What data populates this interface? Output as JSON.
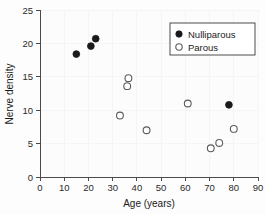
{
  "chart_data": {
    "type": "scatter",
    "title": "",
    "xlabel": "Age (years)",
    "ylabel": "Nerve density",
    "xlim": [
      0,
      90
    ],
    "ylim": [
      0,
      25
    ],
    "xticks": [
      0,
      10,
      20,
      30,
      40,
      50,
      60,
      70,
      80,
      90
    ],
    "yticks": [
      0,
      5,
      10,
      15,
      20,
      25
    ],
    "grid": true,
    "legend_position": "top-right",
    "series": [
      {
        "name": "Nulliparous",
        "marker": "filled-circle",
        "color": "#1a1a1a",
        "points": [
          {
            "x": 15,
            "y": 18.4
          },
          {
            "x": 21,
            "y": 19.6
          },
          {
            "x": 23,
            "y": 20.7
          },
          {
            "x": 78,
            "y": 10.8
          }
        ]
      },
      {
        "name": "Parous",
        "marker": "open-circle",
        "color": "#5a5a5a",
        "points": [
          {
            "x": 33,
            "y": 9.2
          },
          {
            "x": 36,
            "y": 13.6
          },
          {
            "x": 36.5,
            "y": 14.8
          },
          {
            "x": 44,
            "y": 7.0
          },
          {
            "x": 61,
            "y": 11.0
          },
          {
            "x": 70.5,
            "y": 4.3
          },
          {
            "x": 74,
            "y": 5.1
          },
          {
            "x": 80,
            "y": 7.2
          }
        ]
      }
    ]
  },
  "legend": {
    "entries": [
      {
        "label": "Nulliparous",
        "marker": "filled-circle"
      },
      {
        "label": "Parous",
        "marker": "open-circle"
      }
    ]
  },
  "axes": {
    "x_title": "Age (years)",
    "y_title": "Nerve density",
    "x_tick_labels": [
      "0",
      "10",
      "20",
      "30",
      "40",
      "50",
      "60",
      "70",
      "80",
      "90"
    ],
    "y_tick_labels": [
      "0",
      "5",
      "10",
      "15",
      "20",
      "25"
    ]
  },
  "colors": {
    "nulliparous": "#1a1a1a",
    "parous": "#5a5a5a",
    "axis": "#4a4a4a",
    "grid": "#f2f2f2",
    "background": "#fcfcfc"
  }
}
